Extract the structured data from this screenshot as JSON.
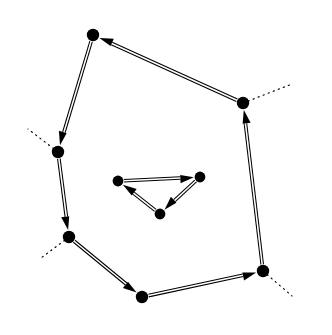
{
  "figure": {
    "background_color": "#ffffff",
    "ink_color": "#000000",
    "width": 332,
    "height": 335
  },
  "style": {
    "node_radius": 6.2,
    "inner_node_radius": 5.4,
    "edge_gap": 2.6,
    "arrow_length": 13.5,
    "arrow_half_width": 5.2,
    "stroke_width": 1.05
  },
  "graph": {
    "directed": true,
    "outer_cycle": {
      "name": "outer-cycle",
      "node_count": 7,
      "nodes": [
        {
          "id": "n-top",
          "label": "top",
          "x": 93,
          "y": 35
        },
        {
          "id": "n-left-upper",
          "label": "left-upper",
          "x": 58,
          "y": 152
        },
        {
          "id": "n-left-lower",
          "label": "left-lower",
          "x": 69,
          "y": 237
        },
        {
          "id": "n-bottom",
          "label": "bottom",
          "x": 142,
          "y": 297
        },
        {
          "id": "n-bottom-right",
          "label": "bottom-right",
          "x": 263,
          "y": 271
        },
        {
          "id": "n-right-upper",
          "label": "right-upper",
          "x": 243,
          "y": 103
        }
      ],
      "edges": [
        {
          "id": "e-top-leftupper",
          "from": "n-top",
          "to": "n-left-upper",
          "direction": "down-left"
        },
        {
          "id": "e-leftupper-leftlower",
          "from": "n-left-upper",
          "to": "n-left-lower",
          "direction": "down"
        },
        {
          "id": "e-leftlower-bottom",
          "from": "n-left-lower",
          "to": "n-bottom",
          "direction": "down-right"
        },
        {
          "id": "e-bottom-bottomright",
          "from": "n-bottom",
          "to": "n-bottom-right",
          "direction": "right"
        },
        {
          "id": "e-bottomright-rightupper",
          "from": "n-bottom-right",
          "to": "n-right-upper",
          "direction": "up"
        },
        {
          "id": "e-rightupper-top",
          "from": "n-right-upper",
          "to": "n-top",
          "direction": "up-left"
        }
      ]
    },
    "inner_cycle": {
      "name": "inner-cycle",
      "node_count": 3,
      "nodes": [
        {
          "id": "m-left",
          "label": "inner-left",
          "x": 118,
          "y": 181
        },
        {
          "id": "m-right",
          "label": "inner-right",
          "x": 200,
          "y": 177
        },
        {
          "id": "m-bottom",
          "label": "inner-bottom",
          "x": 160,
          "y": 214
        }
      ],
      "edges": [
        {
          "id": "e-mleft-mright",
          "from": "m-left",
          "to": "m-right",
          "direction": "right"
        },
        {
          "id": "e-mright-mbottom",
          "from": "m-right",
          "to": "m-bottom",
          "direction": "down-left"
        },
        {
          "id": "e-mbottom-mleft",
          "from": "m-bottom",
          "to": "m-left",
          "direction": "up-left"
        }
      ]
    },
    "dotted_stubs": [
      {
        "id": "s-left-upper",
        "at": "n-left-upper",
        "x1": 58,
        "y1": 152,
        "x2": 28,
        "y2": 129
      },
      {
        "id": "s-left-lower",
        "at": "n-left-lower",
        "x1": 69,
        "y1": 237,
        "x2": 41,
        "y2": 258
      },
      {
        "id": "s-bottom-right",
        "at": "n-bottom-right",
        "x1": 263,
        "y1": 271,
        "x2": 292,
        "y2": 296
      },
      {
        "id": "s-right-upper",
        "at": "n-right-upper",
        "x1": 243,
        "y1": 103,
        "x2": 292,
        "y2": 84
      }
    ]
  }
}
